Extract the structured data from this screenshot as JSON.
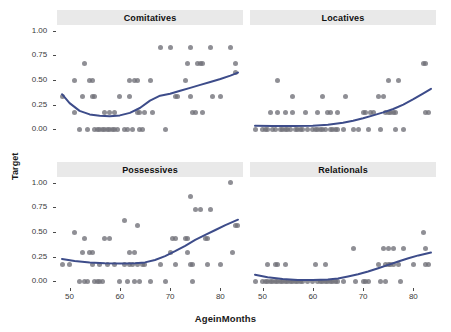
{
  "figure": {
    "xlabel": "AgeinMonths",
    "ylabel": "Target",
    "point_color": "#6f6f77",
    "line_color": "#3d4c8a",
    "strip_background": "#e9e9e9"
  },
  "chart_data": {
    "type": "scatter",
    "title": "",
    "xlabel": "AgeinMonths",
    "ylabel": "Target",
    "xlim": [
      47.5,
      84.5
    ],
    "ylim": [
      -0.06,
      1.06
    ],
    "xticks": [
      50,
      60,
      70,
      80
    ],
    "xtick_labels": [
      "50",
      "60",
      "70",
      "80"
    ],
    "yticks": [
      0.0,
      0.25,
      0.5,
      0.75,
      1.0
    ],
    "ytick_labels": [
      "0.00",
      "0.25",
      "0.50",
      "0.75",
      "1.00"
    ],
    "grid": false,
    "legend": "none",
    "facets": [
      {
        "label": "Comitatives",
        "row": 0,
        "col": 0,
        "points": [
          [
            48.5,
            0.33
          ],
          [
            51,
            0.5
          ],
          [
            51,
            0.17
          ],
          [
            52,
            0.0
          ],
          [
            52.5,
            0.33
          ],
          [
            53,
            0.67
          ],
          [
            53.5,
            0.0
          ],
          [
            54,
            0.5
          ],
          [
            54.5,
            0.5
          ],
          [
            54.5,
            0.33
          ],
          [
            55,
            0.33
          ],
          [
            55,
            0.0
          ],
          [
            55.5,
            0.0
          ],
          [
            56,
            0.0
          ],
          [
            56.5,
            0.0
          ],
          [
            57,
            0.0
          ],
          [
            57,
            0.17
          ],
          [
            57.5,
            0.0
          ],
          [
            58,
            0.17
          ],
          [
            58,
            0.0
          ],
          [
            58.5,
            0.0
          ],
          [
            59,
            0.0
          ],
          [
            59,
            0.17
          ],
          [
            59.5,
            0.0
          ],
          [
            60,
            0.33
          ],
          [
            61,
            0.0
          ],
          [
            61.5,
            0.0
          ],
          [
            62,
            0.33
          ],
          [
            62,
            0.5
          ],
          [
            62.5,
            0.0
          ],
          [
            63,
            0.5
          ],
          [
            63.5,
            0.5
          ],
          [
            63.5,
            0.17
          ],
          [
            64,
            0.0
          ],
          [
            64,
            0.17
          ],
          [
            64.5,
            0.0
          ],
          [
            65,
            0.17
          ],
          [
            66,
            0.5
          ],
          [
            66.5,
            0.17
          ],
          [
            68,
            0.83
          ],
          [
            69,
            0.0
          ],
          [
            70,
            0.83
          ],
          [
            71,
            0.33
          ],
          [
            71.5,
            0.33
          ],
          [
            73,
            0.5
          ],
          [
            73.5,
            0.67
          ],
          [
            74,
            0.83
          ],
          [
            74,
            0.33
          ],
          [
            74.5,
            0.17
          ],
          [
            75,
            0.17
          ],
          [
            75.5,
            0.67
          ],
          [
            76,
            0.67
          ],
          [
            76.5,
            0.67
          ],
          [
            76.5,
            0.17
          ],
          [
            78,
            0.83
          ],
          [
            78.5,
            0.33
          ],
          [
            80,
            0.33
          ],
          [
            82,
            0.83
          ],
          [
            83,
            0.67
          ],
          [
            83,
            0.58
          ]
        ],
        "trend": [
          [
            48.5,
            0.355
          ],
          [
            50,
            0.265
          ],
          [
            52,
            0.185
          ],
          [
            54,
            0.15
          ],
          [
            56,
            0.135
          ],
          [
            58,
            0.13
          ],
          [
            60,
            0.14
          ],
          [
            62,
            0.165
          ],
          [
            64,
            0.215
          ],
          [
            66,
            0.29
          ],
          [
            68,
            0.34
          ],
          [
            70,
            0.36
          ],
          [
            72,
            0.39
          ],
          [
            74,
            0.42
          ],
          [
            76,
            0.45
          ],
          [
            78,
            0.48
          ],
          [
            80,
            0.51
          ],
          [
            82,
            0.545
          ],
          [
            83.5,
            0.575
          ]
        ]
      },
      {
        "label": "Locatives",
        "row": 0,
        "col": 1,
        "points": [
          [
            48.5,
            0.0
          ],
          [
            50,
            0.0
          ],
          [
            50.5,
            0.0
          ],
          [
            51,
            0.0
          ],
          [
            51.5,
            0.17
          ],
          [
            52,
            0.0
          ],
          [
            52.5,
            0.0
          ],
          [
            53,
            0.5
          ],
          [
            53,
            0.17
          ],
          [
            53.5,
            0.0
          ],
          [
            54,
            0.0
          ],
          [
            54.5,
            0.0
          ],
          [
            54.5,
            0.17
          ],
          [
            55,
            0.0
          ],
          [
            55.5,
            0.0
          ],
          [
            56,
            0.17
          ],
          [
            56,
            0.33
          ],
          [
            56.5,
            0.0
          ],
          [
            57,
            0.0
          ],
          [
            57.5,
            0.0
          ],
          [
            58,
            0.0
          ],
          [
            58.5,
            0.17
          ],
          [
            59,
            0.0
          ],
          [
            60,
            0.0
          ],
          [
            60.5,
            0.0
          ],
          [
            61,
            0.17
          ],
          [
            61,
            0.0
          ],
          [
            61.5,
            0.0
          ],
          [
            62,
            0.0
          ],
          [
            62,
            0.33
          ],
          [
            62.5,
            0.0
          ],
          [
            63,
            0.17
          ],
          [
            63.5,
            0.17
          ],
          [
            63.5,
            0.0
          ],
          [
            64,
            0.0
          ],
          [
            64.5,
            0.0
          ],
          [
            65,
            0.17
          ],
          [
            65,
            0.0
          ],
          [
            66,
            0.0
          ],
          [
            66.5,
            0.33
          ],
          [
            68,
            0.0
          ],
          [
            69,
            0.0
          ],
          [
            70,
            0.17
          ],
          [
            70.5,
            0.17
          ],
          [
            71,
            0.0
          ],
          [
            71.5,
            0.17
          ],
          [
            72,
            0.17
          ],
          [
            73,
            0.33
          ],
          [
            73.5,
            0.0
          ],
          [
            74,
            0.33
          ],
          [
            74.5,
            0.17
          ],
          [
            75,
            0.17
          ],
          [
            75,
            0.5
          ],
          [
            75.5,
            0.17
          ],
          [
            76,
            0.17
          ],
          [
            76.5,
            0.17
          ],
          [
            76.5,
            0.0
          ],
          [
            77,
            0.5
          ],
          [
            78,
            0.0
          ],
          [
            82,
            0.67
          ],
          [
            82.5,
            0.67
          ],
          [
            82.5,
            0.17
          ],
          [
            83,
            0.17
          ]
        ],
        "trend": [
          [
            48.5,
            0.035
          ],
          [
            52,
            0.033
          ],
          [
            56,
            0.032
          ],
          [
            60,
            0.035
          ],
          [
            63,
            0.045
          ],
          [
            66,
            0.065
          ],
          [
            68,
            0.085
          ],
          [
            70,
            0.11
          ],
          [
            72,
            0.14
          ],
          [
            74,
            0.17
          ],
          [
            76,
            0.205
          ],
          [
            78,
            0.25
          ],
          [
            80,
            0.305
          ],
          [
            82,
            0.365
          ],
          [
            83.5,
            0.41
          ]
        ]
      },
      {
        "label": "Possessives",
        "row": 1,
        "col": 0,
        "points": [
          [
            48.5,
            0.17
          ],
          [
            50,
            0.17
          ],
          [
            51,
            0.5
          ],
          [
            52,
            0.0
          ],
          [
            52.5,
            0.29
          ],
          [
            53,
            0.43
          ],
          [
            53,
            0.0
          ],
          [
            53.5,
            0.0
          ],
          [
            54,
            0.29
          ],
          [
            54.5,
            0.29
          ],
          [
            54.5,
            0.17
          ],
          [
            55,
            0.0
          ],
          [
            55.5,
            0.0
          ],
          [
            56,
            0.0
          ],
          [
            56,
            0.17
          ],
          [
            56.5,
            0.0
          ],
          [
            57,
            0.43
          ],
          [
            57.5,
            0.17
          ],
          [
            58,
            0.43
          ],
          [
            59,
            0.17
          ],
          [
            60,
            0.0
          ],
          [
            61,
            0.62
          ],
          [
            61,
            0.17
          ],
          [
            61.5,
            0.0
          ],
          [
            62,
            0.29
          ],
          [
            62,
            0.17
          ],
          [
            62.5,
            0.17
          ],
          [
            63,
            0.29
          ],
          [
            63,
            0.0
          ],
          [
            63.5,
            0.57
          ],
          [
            63.5,
            0.17
          ],
          [
            64,
            0.0
          ],
          [
            64.5,
            0.17
          ],
          [
            65,
            0.17
          ],
          [
            66,
            0.0
          ],
          [
            68,
            0.17
          ],
          [
            69,
            0.0
          ],
          [
            70,
            0.29
          ],
          [
            70.5,
            0.43
          ],
          [
            71,
            0.43
          ],
          [
            71,
            0.17
          ],
          [
            73,
            0.43
          ],
          [
            73.5,
            0.29
          ],
          [
            73.5,
            0.43
          ],
          [
            74,
            0.86
          ],
          [
            74,
            0.17
          ],
          [
            74.5,
            0.17
          ],
          [
            74.5,
            0.0
          ],
          [
            75,
            0.73
          ],
          [
            76,
            0.73
          ],
          [
            77,
            0.43
          ],
          [
            77.5,
            0.43
          ],
          [
            77.5,
            0.17
          ],
          [
            78,
            0.73
          ],
          [
            80,
            0.17
          ],
          [
            82,
            1.0
          ],
          [
            82.5,
            0.29
          ],
          [
            83,
            0.57
          ],
          [
            83.5,
            0.57
          ]
        ],
        "trend": [
          [
            48.5,
            0.225
          ],
          [
            51,
            0.205
          ],
          [
            54,
            0.19
          ],
          [
            57,
            0.182
          ],
          [
            60,
            0.18
          ],
          [
            63,
            0.182
          ],
          [
            65,
            0.19
          ],
          [
            67,
            0.215
          ],
          [
            69,
            0.255
          ],
          [
            71,
            0.305
          ],
          [
            73,
            0.36
          ],
          [
            75,
            0.42
          ],
          [
            77,
            0.47
          ],
          [
            79,
            0.52
          ],
          [
            81,
            0.57
          ],
          [
            83.5,
            0.625
          ]
        ]
      },
      {
        "label": "Relationals",
        "row": 1,
        "col": 1,
        "points": [
          [
            48.5,
            0.0
          ],
          [
            50,
            0.0
          ],
          [
            50.5,
            0.0
          ],
          [
            51,
            0.17
          ],
          [
            51,
            0.0
          ],
          [
            51.5,
            0.0
          ],
          [
            52,
            0.0
          ],
          [
            52.5,
            0.17
          ],
          [
            52.5,
            0.0
          ],
          [
            53,
            0.17
          ],
          [
            53,
            0.0
          ],
          [
            53.5,
            0.0
          ],
          [
            54,
            0.0
          ],
          [
            54.5,
            0.17
          ],
          [
            54.5,
            0.0
          ],
          [
            55,
            0.0
          ],
          [
            55.5,
            0.0
          ],
          [
            56,
            0.0
          ],
          [
            56.5,
            0.0
          ],
          [
            57,
            0.0
          ],
          [
            57.5,
            0.0
          ],
          [
            58,
            0.0
          ],
          [
            59,
            0.0
          ],
          [
            60,
            0.0
          ],
          [
            60.5,
            0.17
          ],
          [
            61,
            0.0
          ],
          [
            61.5,
            0.0
          ],
          [
            62,
            0.0
          ],
          [
            62.5,
            0.17
          ],
          [
            62.5,
            0.0
          ],
          [
            63,
            0.0
          ],
          [
            63.5,
            0.0
          ],
          [
            64,
            0.0
          ],
          [
            64.5,
            0.0
          ],
          [
            65,
            0.0
          ],
          [
            66,
            0.0
          ],
          [
            68,
            0.33
          ],
          [
            68.5,
            0.0
          ],
          [
            70,
            0.0
          ],
          [
            70.5,
            0.0
          ],
          [
            71,
            0.0
          ],
          [
            73,
            0.17
          ],
          [
            73.5,
            0.0
          ],
          [
            74,
            0.33
          ],
          [
            74.5,
            0.17
          ],
          [
            74.5,
            0.0
          ],
          [
            75,
            0.17
          ],
          [
            75,
            0.33
          ],
          [
            75.5,
            0.17
          ],
          [
            76,
            0.33
          ],
          [
            76,
            0.17
          ],
          [
            77,
            0.17
          ],
          [
            77.5,
            0.0
          ],
          [
            78,
            0.33
          ],
          [
            80,
            0.17
          ],
          [
            82,
            0.5
          ],
          [
            82.5,
            0.33
          ],
          [
            82.5,
            0.17
          ],
          [
            83,
            0.17
          ]
        ],
        "trend": [
          [
            48.5,
            0.065
          ],
          [
            51,
            0.04
          ],
          [
            54,
            0.022
          ],
          [
            57,
            0.012
          ],
          [
            60,
            0.01
          ],
          [
            63,
            0.015
          ],
          [
            65,
            0.028
          ],
          [
            67,
            0.048
          ],
          [
            69,
            0.07
          ],
          [
            71,
            0.098
          ],
          [
            73,
            0.13
          ],
          [
            75,
            0.165
          ],
          [
            77,
            0.2
          ],
          [
            79,
            0.232
          ],
          [
            81,
            0.262
          ],
          [
            83.5,
            0.29
          ]
        ]
      }
    ]
  }
}
